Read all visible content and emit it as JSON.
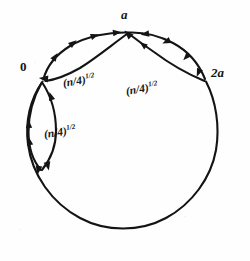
{
  "figure": {
    "kind": "directed-graph-on-circle",
    "background_color": "#fefefe",
    "ink_color": "#141414",
    "nodes": [
      {
        "id": "top",
        "label": "a",
        "x": 128,
        "y": 33,
        "label_x": 121,
        "label_y": 8,
        "italic": true
      },
      {
        "id": "left",
        "label": "0",
        "x": 42,
        "y": 82,
        "label_x": 20,
        "label_y": 60,
        "italic": false
      },
      {
        "id": "right",
        "label": "2a",
        "x": 206,
        "y": 81,
        "label_x": 211,
        "label_y": 66,
        "italic": true
      }
    ],
    "edge_labels": [
      {
        "id": "label-a-to-0",
        "base": "(n/4)",
        "exponent": "1/2",
        "x": 63,
        "y": 78,
        "rotate": -9
      },
      {
        "id": "label-2a-to-a",
        "base": "(n/4)",
        "exponent": "1/2",
        "x": 126,
        "y": 86,
        "rotate": -9
      },
      {
        "id": "label-left-lens",
        "base": "(n/4)",
        "exponent": "1/2",
        "x": 44,
        "y": 129,
        "rotate": -8
      }
    ],
    "circle": {
      "cx": 127,
      "cy": 136,
      "r": 93
    }
  }
}
